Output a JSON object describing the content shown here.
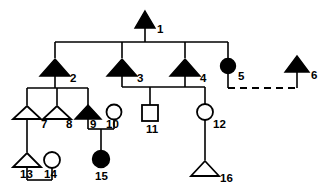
{
  "diagram": {
    "type": "pedigree",
    "colors": {
      "affected_fill": "#000000",
      "unaffected_fill": "#ffffff",
      "stroke": "#000000",
      "background": "#ffffff"
    },
    "legend_semantics": {
      "triangle": "triangle symbol",
      "circle": "female",
      "square": "male",
      "filled": "affected",
      "open": "unaffected",
      "dashed_line": "non-biological / adoptive relationship"
    }
  },
  "individuals": [
    {
      "id": "1",
      "label": "1",
      "shape": "triangle",
      "status": "filled",
      "generation": 1
    },
    {
      "id": "2",
      "label": "2",
      "shape": "triangle",
      "status": "filled",
      "generation": 2
    },
    {
      "id": "3",
      "label": "3",
      "shape": "triangle",
      "status": "filled",
      "generation": 2
    },
    {
      "id": "4",
      "label": "4",
      "shape": "triangle",
      "status": "filled",
      "generation": 2
    },
    {
      "id": "5",
      "label": "5",
      "shape": "circle",
      "status": "filled",
      "generation": 2
    },
    {
      "id": "6",
      "label": "6",
      "shape": "triangle",
      "status": "filled",
      "generation": 2
    },
    {
      "id": "7",
      "label": "7",
      "shape": "triangle",
      "status": "open",
      "generation": 3
    },
    {
      "id": "8",
      "label": "8",
      "shape": "triangle",
      "status": "open",
      "generation": 3
    },
    {
      "id": "9",
      "label": "9",
      "shape": "triangle",
      "status": "filled",
      "generation": 3
    },
    {
      "id": "10",
      "label": "10",
      "shape": "circle",
      "status": "open",
      "generation": 3
    },
    {
      "id": "11",
      "label": "11",
      "shape": "square",
      "status": "open",
      "generation": 3
    },
    {
      "id": "12",
      "label": "12",
      "shape": "circle",
      "status": "open",
      "generation": 3
    },
    {
      "id": "13",
      "label": "13",
      "shape": "triangle",
      "status": "open",
      "generation": 4
    },
    {
      "id": "14",
      "label": "14",
      "shape": "circle",
      "status": "open",
      "generation": 4
    },
    {
      "id": "15",
      "label": "15",
      "shape": "circle",
      "status": "filled",
      "generation": 4
    },
    {
      "id": "16",
      "label": "16",
      "shape": "triangle",
      "status": "open",
      "generation": 4
    }
  ],
  "relationships": [
    {
      "type": "sibship",
      "parent": "1",
      "children": [
        "2",
        "3",
        "4",
        "5"
      ]
    },
    {
      "type": "partnership",
      "partners": [
        "5",
        "6"
      ],
      "line": "dashed"
    },
    {
      "type": "sibship",
      "parent": "2",
      "children": [
        "7",
        "8",
        "9"
      ]
    },
    {
      "type": "partnership",
      "partners": [
        "3",
        "4"
      ],
      "line": "solid"
    },
    {
      "type": "sibship",
      "parents": [
        "3",
        "4"
      ],
      "children": [
        "11",
        "12"
      ]
    },
    {
      "type": "partnership",
      "partners": [
        "9",
        "10"
      ],
      "line": "solid"
    },
    {
      "type": "sibship",
      "parents": [
        "9",
        "10"
      ],
      "children": [
        "15"
      ]
    },
    {
      "type": "sibship",
      "parent": "7",
      "children": [
        "13"
      ]
    },
    {
      "type": "partnership",
      "partners": [
        "13",
        "14"
      ],
      "line": "solid"
    },
    {
      "type": "sibship",
      "parent": "12",
      "children": [
        "16"
      ]
    }
  ],
  "labels": {
    "n1": "1",
    "n2": "2",
    "n3": "3",
    "n4": "4",
    "n5": "5",
    "n6": "6",
    "n7": "7",
    "n8": "8",
    "n9": "9",
    "n10": "10",
    "n11": "11",
    "n12": "12",
    "n13": "13",
    "n14": "14",
    "n15": "15",
    "n16": "16"
  }
}
